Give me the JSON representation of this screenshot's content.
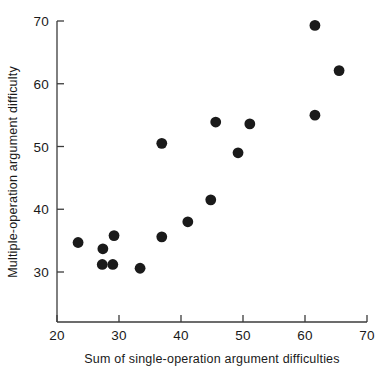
{
  "chart_data": {
    "type": "scatter",
    "title": "",
    "xlabel": "Sum of single-operation argument difficulties",
    "ylabel": "Multiple-operation argument difficulty",
    "xlim": [
      20,
      70
    ],
    "ylim": [
      26,
      70
    ],
    "xticks": [
      20,
      30,
      40,
      50,
      60,
      70
    ],
    "yticks": [
      30,
      40,
      50,
      60,
      70
    ],
    "xtick_labels": [
      "20",
      "30",
      "40",
      "50",
      "60",
      "70"
    ],
    "ytick_labels": [
      "30",
      "40",
      "50",
      "60",
      "70"
    ],
    "grid": false,
    "legend": null,
    "marker": {
      "shape": "circle",
      "color": "#1a1a1a",
      "size": 5.4
    },
    "series": [
      {
        "name": "arguments",
        "points": [
          {
            "x": 23.4,
            "y": 34.7
          },
          {
            "x": 27.4,
            "y": 33.7
          },
          {
            "x": 27.3,
            "y": 31.2
          },
          {
            "x": 29.2,
            "y": 35.8
          },
          {
            "x": 29.0,
            "y": 31.2
          },
          {
            "x": 33.4,
            "y": 30.6
          },
          {
            "x": 36.9,
            "y": 50.5
          },
          {
            "x": 36.9,
            "y": 35.6
          },
          {
            "x": 41.1,
            "y": 38.0
          },
          {
            "x": 44.8,
            "y": 41.5
          },
          {
            "x": 45.6,
            "y": 53.9
          },
          {
            "x": 49.2,
            "y": 49.0
          },
          {
            "x": 51.1,
            "y": 53.6
          },
          {
            "x": 61.6,
            "y": 55.0
          },
          {
            "x": 61.6,
            "y": 69.3
          },
          {
            "x": 65.5,
            "y": 62.1
          }
        ]
      }
    ]
  },
  "axes": {
    "x_axis_name": "x-axis",
    "y_axis_name": "y-axis"
  }
}
